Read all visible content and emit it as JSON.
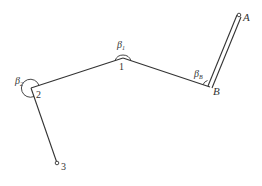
{
  "diagram": {
    "points": [
      {
        "id": "A",
        "label": "A"
      },
      {
        "id": "B",
        "label": "B"
      },
      {
        "id": "1",
        "label": "1"
      },
      {
        "id": "2",
        "label": "2"
      },
      {
        "id": "3",
        "label": "3"
      }
    ],
    "angles": [
      {
        "at": "B",
        "symbol": "β",
        "subscript": "B"
      },
      {
        "at": "1",
        "symbol": "β",
        "subscript": "1"
      },
      {
        "at": "2",
        "symbol": "β",
        "subscript": "2"
      }
    ],
    "edges": [
      {
        "from": "A",
        "to": "B",
        "style": "double"
      },
      {
        "from": "B",
        "to": "1",
        "style": "single"
      },
      {
        "from": "1",
        "to": "2",
        "style": "single"
      },
      {
        "from": "2",
        "to": "3",
        "style": "single"
      }
    ]
  }
}
